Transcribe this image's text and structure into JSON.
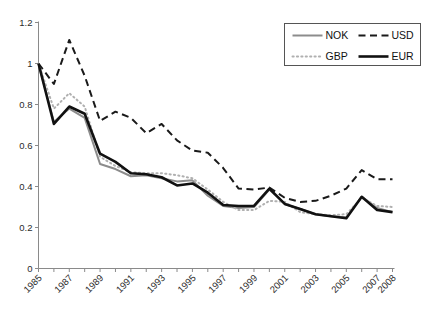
{
  "chart_data": {
    "type": "line",
    "title": "",
    "subtitle": "",
    "xlabel": "",
    "ylabel": "",
    "xlim": [
      1985,
      2008
    ],
    "ylim": [
      0,
      1.2
    ],
    "grid": false,
    "legend_position": "top-right",
    "y_ticks": [
      "0",
      "0.2",
      "0.4",
      "0.6",
      "0.8",
      "1",
      "1.2"
    ],
    "y_tick_values": [
      0,
      0.2,
      0.4,
      0.6,
      0.8,
      1.0,
      1.2
    ],
    "x": [
      1985,
      1986,
      1987,
      1988,
      1989,
      1990,
      1991,
      1992,
      1993,
      1994,
      1995,
      1996,
      1997,
      1998,
      1999,
      2000,
      2001,
      2002,
      2003,
      2004,
      2005,
      2006,
      2007,
      2008
    ],
    "x_tick_labels": [
      "1985",
      "",
      "1987",
      "",
      "1989",
      "",
      "1991",
      "",
      "1993",
      "",
      "1995",
      "",
      "1997",
      "",
      "1999",
      "",
      "2001",
      "",
      "2003",
      "",
      "2005",
      "",
      "2007",
      "2008"
    ],
    "x_labels_visible": [
      "1985",
      "1987",
      "1989",
      "1991",
      "1993",
      "1995",
      "1997",
      "1999",
      "2001",
      "2003",
      "2005",
      "2007",
      "2008"
    ],
    "series": [
      {
        "name": "NOK",
        "style": "solid",
        "color": "#8c8c8c",
        "width": 2.0,
        "values": [
          1.0,
          0.715,
          0.78,
          0.735,
          0.51,
          0.485,
          0.45,
          0.455,
          0.44,
          0.425,
          0.43,
          0.355,
          0.305,
          0.295,
          0.3,
          0.385,
          0.315,
          0.29,
          0.265,
          0.255,
          0.25,
          0.35,
          0.295,
          0.275
        ]
      },
      {
        "name": "USD",
        "style": "dashed",
        "color": "#1a1a1a",
        "width": 2.0,
        "values": [
          1.0,
          0.9,
          1.115,
          0.94,
          0.72,
          0.765,
          0.735,
          0.66,
          0.705,
          0.625,
          0.575,
          0.565,
          0.49,
          0.39,
          0.385,
          0.395,
          0.345,
          0.325,
          0.33,
          0.355,
          0.39,
          0.48,
          0.435,
          0.435
        ]
      },
      {
        "name": "GBP",
        "style": "dotted",
        "color": "#b0b0b0",
        "width": 2.0,
        "values": [
          1.0,
          0.78,
          0.855,
          0.79,
          0.545,
          0.5,
          0.47,
          0.465,
          0.465,
          0.455,
          0.44,
          0.385,
          0.325,
          0.285,
          0.285,
          0.33,
          0.325,
          0.275,
          0.265,
          0.26,
          0.265,
          0.345,
          0.305,
          0.3
        ]
      },
      {
        "name": "EUR",
        "style": "solid",
        "color": "#111111",
        "width": 2.6,
        "values": [
          1.0,
          0.705,
          0.79,
          0.755,
          0.56,
          0.52,
          0.465,
          0.46,
          0.445,
          0.405,
          0.415,
          0.37,
          0.31,
          0.305,
          0.305,
          0.39,
          0.315,
          0.29,
          0.265,
          0.255,
          0.245,
          0.35,
          0.285,
          0.275
        ]
      }
    ]
  },
  "legend": {
    "entries": [
      {
        "label": "NOK"
      },
      {
        "label": "USD"
      },
      {
        "label": "GBP"
      },
      {
        "label": "EUR"
      }
    ]
  }
}
